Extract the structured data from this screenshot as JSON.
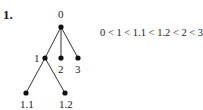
{
  "figure": {
    "number": "1.",
    "tree": {
      "root": "0",
      "nodes": [
        {
          "id": "0",
          "label": "0",
          "x": 61,
          "y": 27,
          "parent": null
        },
        {
          "id": "1",
          "label": "1",
          "x": 45,
          "y": 58,
          "parent": "0"
        },
        {
          "id": "2",
          "label": "2",
          "x": 61,
          "y": 58,
          "parent": "0"
        },
        {
          "id": "3",
          "label": "3",
          "x": 78,
          "y": 58,
          "parent": "0"
        },
        {
          "id": "1.1",
          "label": "1.1",
          "x": 26,
          "y": 93,
          "parent": "1"
        },
        {
          "id": "1.2",
          "label": "1.2",
          "x": 65,
          "y": 93,
          "parent": "1"
        }
      ]
    },
    "ordering": "0 < 1 < 1.1 < 1.2 < 2 < 3"
  }
}
